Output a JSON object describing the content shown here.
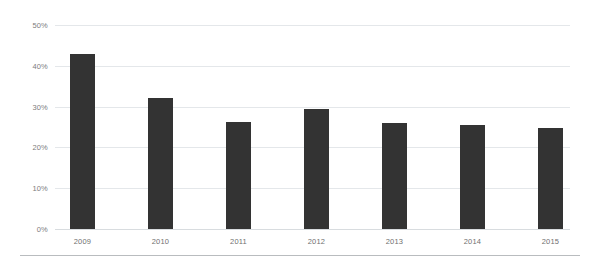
{
  "chart_data": {
    "type": "bar",
    "title": "",
    "xlabel": "",
    "ylabel": "",
    "categories": [
      "2009",
      "2010",
      "2011",
      "2012",
      "2013",
      "2014",
      "2015"
    ],
    "values": [
      43,
      32,
      26.2,
      29.5,
      26,
      25.5,
      24.7
    ],
    "ylim": [
      0,
      50
    ],
    "ytick_values": [
      0,
      10,
      20,
      30,
      40,
      50
    ],
    "ytick_labels": [
      "0%",
      "10%",
      "20%",
      "30%",
      "40%",
      "50%"
    ],
    "grid": true,
    "legend": "none",
    "series": [
      {
        "name": "",
        "values": [
          43,
          32,
          26.2,
          29.5,
          26,
          25.5,
          24.7
        ]
      }
    ],
    "colors": {
      "bar": "#333333",
      "gridline": "#e4e7ea",
      "axis_text": "#7d7d7d",
      "rule": "#b9bcbf",
      "background": "#ffffff"
    }
  }
}
